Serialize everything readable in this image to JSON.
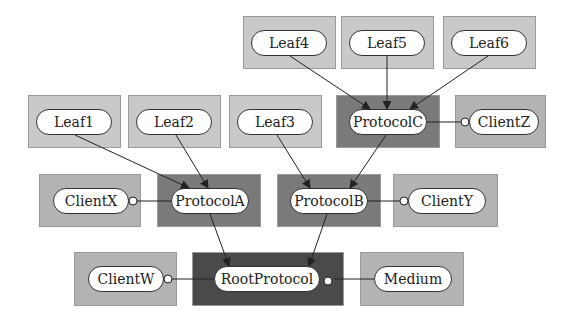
{
  "diagram": {
    "nodes": {
      "leaf4": {
        "label": "Leaf4"
      },
      "leaf5": {
        "label": "Leaf5"
      },
      "leaf6": {
        "label": "Leaf6"
      },
      "leaf1": {
        "label": "Leaf1"
      },
      "leaf2": {
        "label": "Leaf2"
      },
      "leaf3": {
        "label": "Leaf3"
      },
      "protocolC": {
        "label": "ProtocolC"
      },
      "clientZ": {
        "label": "ClientZ"
      },
      "clientX": {
        "label": "ClientX"
      },
      "protocolA": {
        "label": "ProtocolA"
      },
      "protocolB": {
        "label": "ProtocolB"
      },
      "clientY": {
        "label": "ClientY"
      },
      "clientW": {
        "label": "ClientW"
      },
      "rootProtocol": {
        "label": "RootProtocol"
      },
      "medium": {
        "label": "Medium"
      }
    },
    "edges": [
      {
        "from": "Leaf4",
        "to": "ProtocolC",
        "type": "arrow"
      },
      {
        "from": "Leaf5",
        "to": "ProtocolC",
        "type": "arrow"
      },
      {
        "from": "Leaf6",
        "to": "ProtocolC",
        "type": "arrow"
      },
      {
        "from": "Leaf1",
        "to": "ProtocolA",
        "type": "arrow"
      },
      {
        "from": "Leaf2",
        "to": "ProtocolA",
        "type": "arrow"
      },
      {
        "from": "Leaf3",
        "to": "ProtocolB",
        "type": "arrow"
      },
      {
        "from": "ProtocolC",
        "to": "ProtocolB",
        "type": "arrow"
      },
      {
        "from": "ProtocolA",
        "to": "RootProtocol",
        "type": "arrow"
      },
      {
        "from": "ProtocolB",
        "to": "RootProtocol",
        "type": "arrow"
      },
      {
        "from": "ProtocolC",
        "to": "ClientZ",
        "type": "interface"
      },
      {
        "from": "ProtocolA",
        "to": "ClientX",
        "type": "interface"
      },
      {
        "from": "ProtocolB",
        "to": "ClientY",
        "type": "interface"
      },
      {
        "from": "RootProtocol",
        "to": "ClientW",
        "type": "interface"
      },
      {
        "from": "RootProtocol",
        "to": "Medium",
        "type": "interface"
      }
    ],
    "colors": {
      "leaf_box": "#c9c9c9",
      "client_box": "#b3b3b3",
      "protocol_box": "#7a7a7a",
      "root_box": "#4a4a4a",
      "pill": "#ffffff",
      "line": "#222222"
    }
  }
}
